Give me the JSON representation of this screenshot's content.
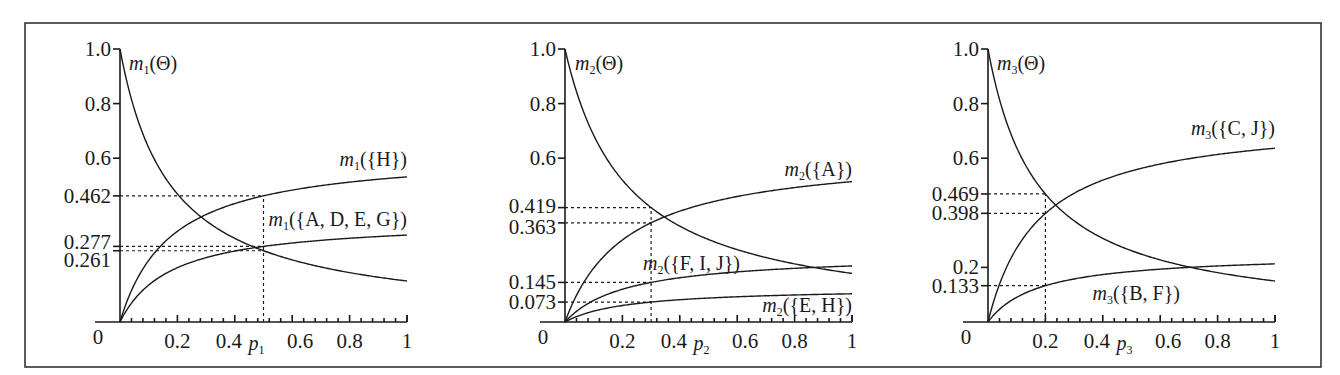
{
  "chart_data": [
    {
      "type": "line",
      "panel": 1,
      "xlabel": "p1",
      "x_ticks": [
        "0.2",
        "0.4",
        "0.6",
        "0.8",
        "1"
      ],
      "y_ticks": [
        "0",
        "0.261",
        "0.277",
        "0.462",
        "0.6",
        "0.8",
        "1.0"
      ],
      "xlim": [
        0,
        1
      ],
      "ylim": [
        0,
        1
      ],
      "marker": {
        "x": 0.5,
        "values": {
          "m1({H})": 0.462,
          "m1({A, D, E, G})": 0.277,
          "m1(Θ)": 0.261
        }
      },
      "series": [
        {
          "name": "m1(Θ)",
          "x": [
            0,
            0.1,
            0.2,
            0.3,
            0.4,
            0.5,
            0.6,
            0.7,
            0.8,
            0.9,
            1.0
          ],
          "values": [
            1.0,
            0.639,
            0.469,
            0.371,
            0.306,
            0.261,
            0.228,
            0.202,
            0.181,
            0.164,
            0.15
          ]
        },
        {
          "name": "m1({H})",
          "x": [
            0,
            0.1,
            0.2,
            0.3,
            0.4,
            0.5,
            0.6,
            0.7,
            0.8,
            0.9,
            1.0
          ],
          "values": [
            0,
            0.226,
            0.332,
            0.394,
            0.434,
            0.462,
            0.483,
            0.499,
            0.512,
            0.522,
            0.531
          ]
        },
        {
          "name": "m1({A, D, E, G})",
          "x": [
            0,
            0.1,
            0.2,
            0.3,
            0.4,
            0.5,
            0.6,
            0.7,
            0.8,
            0.9,
            1.0
          ],
          "values": [
            0,
            0.135,
            0.199,
            0.236,
            0.26,
            0.277,
            0.29,
            0.299,
            0.307,
            0.313,
            0.318
          ]
        }
      ],
      "params": {
        "k": 5.66,
        "coef": {
          "m1({H})": 3.54,
          "m1({A, D, E, G})": 2.12
        }
      },
      "label_text": {
        "theta": "(Θ)",
        "h": "({H})",
        "adeg": "({A, D, E, G})"
      }
    },
    {
      "type": "line",
      "panel": 2,
      "xlabel": "p2",
      "x_ticks": [
        "0.2",
        "0.4",
        "0.6",
        "0.8",
        "1"
      ],
      "y_ticks": [
        "0",
        "0.073",
        "0.145",
        "0.363",
        "0.419",
        "0.6",
        "0.8",
        "1.0"
      ],
      "xlim": [
        0,
        1
      ],
      "ylim": [
        0,
        1
      ],
      "marker": {
        "x": 0.3,
        "values": {
          "m2(Θ)": 0.419,
          "m2({A})": 0.363,
          "m2({F, I, J})": 0.145,
          "m2({E, H})": 0.073
        }
      },
      "series": [
        {
          "name": "m2(Θ)",
          "x": [
            0,
            0.1,
            0.2,
            0.3,
            0.4,
            0.5,
            0.6,
            0.7,
            0.8,
            0.9,
            1.0
          ],
          "values": [
            1.0,
            0.684,
            0.52,
            0.419,
            0.351,
            0.302,
            0.265,
            0.236,
            0.213,
            0.194,
            0.178
          ]
        },
        {
          "name": "m2({A})",
          "x": [
            0,
            0.1,
            0.2,
            0.3,
            0.4,
            0.5,
            0.6,
            0.7,
            0.8,
            0.9,
            1.0
          ],
          "values": [
            0,
            0.198,
            0.3,
            0.363,
            0.406,
            0.437,
            0.46,
            0.478,
            0.492,
            0.504,
            0.514
          ]
        },
        {
          "name": "m2({F, I, J})",
          "x": [
            0,
            0.1,
            0.2,
            0.3,
            0.4,
            0.5,
            0.6,
            0.7,
            0.8,
            0.9,
            1.0
          ],
          "values": [
            0,
            0.079,
            0.12,
            0.145,
            0.162,
            0.174,
            0.183,
            0.191,
            0.196,
            0.201,
            0.205
          ]
        },
        {
          "name": "m2({E, H})",
          "x": [
            0,
            0.1,
            0.2,
            0.3,
            0.4,
            0.5,
            0.6,
            0.7,
            0.8,
            0.9,
            1.0
          ],
          "values": [
            0,
            0.04,
            0.06,
            0.073,
            0.082,
            0.088,
            0.092,
            0.096,
            0.099,
            0.101,
            0.103
          ]
        }
      ],
      "params": {
        "k": 4.62,
        "coef": {
          "m2({A})": 2.89,
          "m2({F, I, J})": 1.154,
          "m2({E, H})": 0.581
        }
      },
      "label_text": {
        "theta": "(Θ)",
        "a": "({A})",
        "fij": "({F, I, J})",
        "eh": "({E, H})"
      }
    },
    {
      "type": "line",
      "panel": 3,
      "xlabel": "p3",
      "x_ticks": [
        "0.2",
        "0.4",
        "0.6",
        "0.8",
        "1"
      ],
      "y_ticks": [
        "0",
        "0.133",
        "0.2",
        "0.398",
        "0.469",
        "0.6",
        "0.8",
        "1.0"
      ],
      "xlim": [
        0,
        1
      ],
      "ylim": [
        0,
        1
      ],
      "marker": {
        "x": 0.2,
        "values": {
          "m3(Θ)": 0.469,
          "m3({C, J})": 0.398,
          "m3({B, F})": 0.133
        }
      },
      "series": [
        {
          "name": "m3(Θ)",
          "x": [
            0,
            0.1,
            0.2,
            0.3,
            0.4,
            0.5,
            0.6,
            0.7,
            0.8,
            0.9,
            1.0
          ],
          "values": [
            1.0,
            0.639,
            0.469,
            0.371,
            0.306,
            0.261,
            0.228,
            0.202,
            0.181,
            0.164,
            0.15
          ]
        },
        {
          "name": "m3({C, J})",
          "x": [
            0,
            0.1,
            0.2,
            0.3,
            0.4,
            0.5,
            0.6,
            0.7,
            0.8,
            0.9,
            1.0
          ],
          "values": [
            0,
            0.271,
            0.398,
            0.472,
            0.519,
            0.553,
            0.578,
            0.598,
            0.613,
            0.625,
            0.636
          ]
        },
        {
          "name": "m3({B, F})",
          "x": [
            0,
            0.1,
            0.2,
            0.3,
            0.4,
            0.5,
            0.6,
            0.7,
            0.8,
            0.9,
            1.0
          ],
          "values": [
            0,
            0.091,
            0.133,
            0.158,
            0.174,
            0.185,
            0.194,
            0.2,
            0.205,
            0.209,
            0.213
          ]
        }
      ],
      "params": {
        "k": 5.66,
        "coef": {
          "m3({C, J})": 4.24,
          "m3({B, F})": 1.418
        }
      },
      "label_text": {
        "theta": "(Θ)",
        "cj": "({C, J})",
        "bf": "({B, F})"
      }
    }
  ],
  "common": {
    "m": "m",
    "p": "p",
    "origin": "0",
    "subs": [
      "1",
      "2",
      "3"
    ]
  }
}
